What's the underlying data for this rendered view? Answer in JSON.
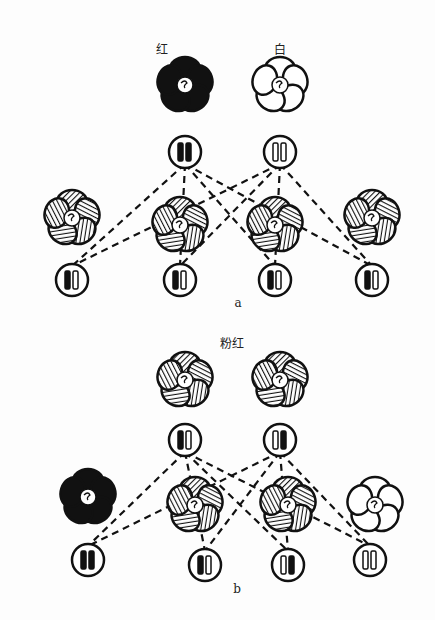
{
  "panel_a": {
    "caption": "a",
    "parent_labels": [
      "红",
      "白"
    ],
    "parents": [
      {
        "x": 185,
        "y": 85,
        "fill": "black",
        "genotype": [
          "black",
          "black"
        ],
        "gx": 185,
        "gy": 152
      },
      {
        "x": 280,
        "y": 85,
        "fill": "white",
        "genotype": [
          "white",
          "white"
        ],
        "gx": 280,
        "gy": 152
      }
    ],
    "offspring": [
      {
        "x": 72,
        "y": 218,
        "fill": "hatched",
        "genotype": [
          "black",
          "white"
        ],
        "gx": 72,
        "gy": 280
      },
      {
        "x": 180,
        "y": 225,
        "fill": "hatched",
        "genotype": [
          "black",
          "white"
        ],
        "gx": 180,
        "gy": 280
      },
      {
        "x": 275,
        "y": 225,
        "fill": "hatched",
        "genotype": [
          "black",
          "white"
        ],
        "gx": 275,
        "gy": 280
      },
      {
        "x": 372,
        "y": 218,
        "fill": "hatched",
        "genotype": [
          "black",
          "white"
        ],
        "gx": 372,
        "gy": 280
      }
    ]
  },
  "panel_b": {
    "caption": "b",
    "parent_label": "粉红",
    "parents": [
      {
        "x": 185,
        "y": 380,
        "fill": "hatched",
        "genotype": [
          "black",
          "white"
        ],
        "gx": 185,
        "gy": 440
      },
      {
        "x": 280,
        "y": 380,
        "fill": "hatched",
        "genotype": [
          "white",
          "black"
        ],
        "gx": 280,
        "gy": 440
      }
    ],
    "offspring": [
      {
        "x": 88,
        "y": 497,
        "fill": "black",
        "genotype": [
          "black",
          "black"
        ],
        "gx": 88,
        "gy": 560
      },
      {
        "x": 195,
        "y": 505,
        "fill": "hatched",
        "genotype": [
          "black",
          "white"
        ],
        "gx": 205,
        "gy": 565
      },
      {
        "x": 288,
        "y": 505,
        "fill": "hatched",
        "genotype": [
          "white",
          "black"
        ],
        "gx": 288,
        "gy": 565
      },
      {
        "x": 375,
        "y": 505,
        "fill": "white",
        "genotype": [
          "white",
          "white"
        ],
        "gx": 370,
        "gy": 560
      }
    ]
  },
  "colors": {
    "ink": "#111111",
    "paper": "#fdfdfd"
  }
}
